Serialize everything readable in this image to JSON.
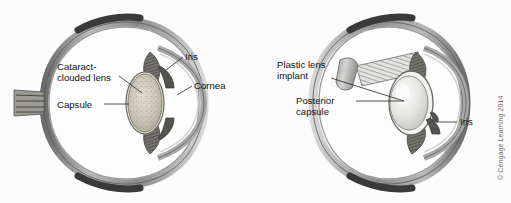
{
  "figure": {
    "background_color": "#fcfcfc",
    "ink_color": "#141414",
    "panels": [
      {
        "id": "cataract-eye",
        "name": "Eye with cataract",
        "labels": [
          {
            "id": "cataract-clouded-lens",
            "line1": "Cataract-",
            "line2": "clouded lens"
          },
          {
            "id": "capsule",
            "text": "Capsule"
          },
          {
            "id": "iris",
            "text": "Iris"
          },
          {
            "id": "cornea",
            "text": "Cornea"
          }
        ]
      },
      {
        "id": "implant-eye",
        "name": "Eye with plastic lens implant",
        "labels": [
          {
            "id": "plastic-lens-implant",
            "line1": "Plastic lens",
            "line2": "implant"
          },
          {
            "id": "posterior-capsule",
            "line1": "Posterior",
            "line2": "capsule"
          },
          {
            "id": "iris",
            "text": "Iris"
          }
        ]
      }
    ],
    "copyright": "© Cengage Learning 2014",
    "colors": {
      "sclera_outer": "#4a4a4a",
      "sclera_mid": "#8e8e8e",
      "sclera_inner": "#cfcfcf",
      "muscle_band": "#3a3a38",
      "cataract_lens": "#cfcabd",
      "implant_lens": "#e4e4e2",
      "ciliary": "#6a6a68",
      "vitreous": "#fdfdfd"
    }
  }
}
